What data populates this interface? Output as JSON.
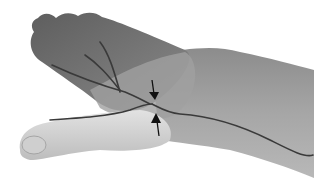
{
  "image": {
    "description": "Grayscale photograph of a hand (dorsal view, thumb extended) with drawn nerve branch lines and two arrows indicating a compression point near the thumb base",
    "colors": {
      "background": "#ffffff",
      "skin_dark": "#6e6e6e",
      "skin_mid": "#9a9a9a",
      "skin_light": "#c8c8c8",
      "thumb_light": "#d6d6d6",
      "nerve_line": "#3a3a3a",
      "arrow": "#111111"
    },
    "annotations": {
      "arrows": [
        {
          "name": "upper-arrow",
          "direction": "down",
          "from": [
            152,
            80
          ],
          "to": [
            155,
            100
          ]
        },
        {
          "name": "lower-arrow",
          "direction": "up",
          "from": [
            158,
            136
          ],
          "to": [
            155,
            114
          ]
        }
      ],
      "nerve_lines": [
        "finger-branch-1",
        "finger-branch-2",
        "finger-branch-3",
        "thumb-branch",
        "forearm-trunk"
      ]
    }
  }
}
